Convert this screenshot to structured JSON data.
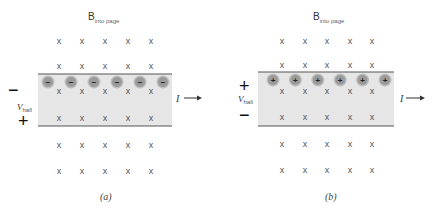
{
  "figure": {
    "panels": [
      {
        "id": "a",
        "caption": "(a)",
        "field_label": "B",
        "field_subscript": "into page",
        "field_symbol": "x",
        "carrier_charge": "−",
        "top_terminal_sign": "−",
        "bottom_terminal_sign": "+",
        "voltage_label": "V",
        "voltage_subscript": "hall",
        "current_label": "I",
        "carrier_count": 6,
        "field_columns": 5,
        "field_rows": 6
      },
      {
        "id": "b",
        "caption": "(b)",
        "field_label": "B",
        "field_subscript": "into page",
        "field_symbol": "x",
        "carrier_charge": "+",
        "top_terminal_sign": "+",
        "bottom_terminal_sign": "−",
        "voltage_label": "V",
        "voltage_subscript": "hall",
        "current_label": "I",
        "carrier_count": 6,
        "field_columns": 5,
        "field_rows": 6
      }
    ],
    "colors": {
      "slab_fill": "#e6e6e6",
      "slab_edge": "#555555",
      "carrier_fill": "#9a9a9a",
      "carrier_halo": "#bdbdbd",
      "field_mark": "#555555"
    }
  }
}
